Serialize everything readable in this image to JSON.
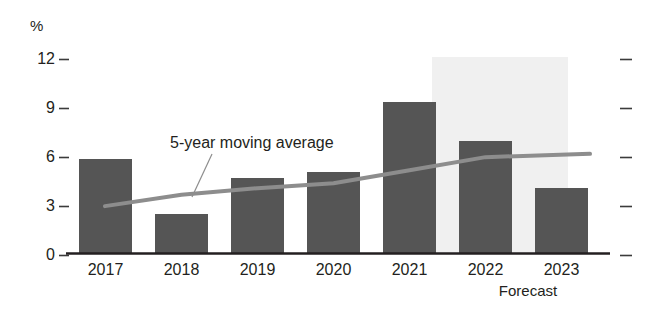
{
  "chart_data": {
    "type": "bar",
    "title": "",
    "subtitle": "",
    "xlabel": "",
    "ylabel": "%",
    "y_unit_symbol": "%",
    "categories": [
      "2017",
      "2018",
      "2019",
      "2020",
      "2021",
      "2022",
      "2023"
    ],
    "values": [
      5.8,
      2.4,
      4.6,
      5.0,
      9.3,
      6.9,
      4.0
    ],
    "ylim": [
      0,
      12
    ],
    "yticks": [
      0,
      3,
      6,
      9,
      12
    ],
    "ytick_labels": [
      "0",
      "3",
      "6",
      "9",
      "12"
    ],
    "grid": false,
    "legend": "none",
    "series": [
      {
        "name": "Annual value",
        "type": "bar",
        "values": [
          5.8,
          2.4,
          4.6,
          5.0,
          9.3,
          6.9,
          4.0
        ],
        "color": "#555555"
      },
      {
        "name": "5-year moving average",
        "type": "line",
        "x": [
          "2017",
          "2018",
          "2019",
          "2020",
          "2021",
          "2022",
          "2023"
        ],
        "values": [
          2.9,
          3.6,
          4.0,
          4.3,
          5.1,
          5.9,
          6.1
        ],
        "color": "#8d8d8d"
      }
    ],
    "annotations": [
      {
        "text": "5-year moving average",
        "target_series": "5-year moving average",
        "has_leader_line": true
      },
      {
        "text": "Forecast",
        "covers_categories": [
          "2022",
          "2023"
        ],
        "shaded_band": true,
        "band_color": "#f0f0f0"
      }
    ],
    "forecast_start_category": "2022",
    "right_axis_ticks": [
      0,
      3,
      6,
      9,
      12
    ]
  },
  "labels": {
    "y_unit": "%",
    "annotation_moving_average": "5-year moving average",
    "forecast": "Forecast"
  },
  "colors": {
    "bar": "#555555",
    "line": "#8d8d8d",
    "forecast_band": "#f0f0f0",
    "axis": "#231f20",
    "text": "#231f20",
    "background": "#ffffff"
  }
}
